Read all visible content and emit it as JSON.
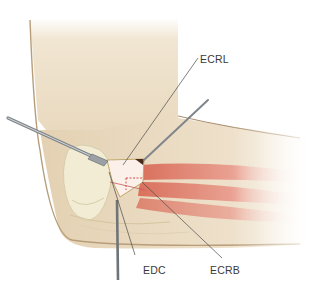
{
  "figure": {
    "labels": [
      {
        "id": "ecrl",
        "text": "ECRL"
      },
      {
        "id": "edc",
        "text": "EDC"
      },
      {
        "id": "ecrb",
        "text": "ECRB"
      }
    ],
    "colors": {
      "skin": "#e9d9c0",
      "skin_shadow": "#c9b190",
      "bone": "#efe9cf",
      "muscle": "#e08a78",
      "instrument": "#8a8f93",
      "leader_line": "#4a4a4a",
      "incision_dash": "#d23a3a"
    }
  }
}
